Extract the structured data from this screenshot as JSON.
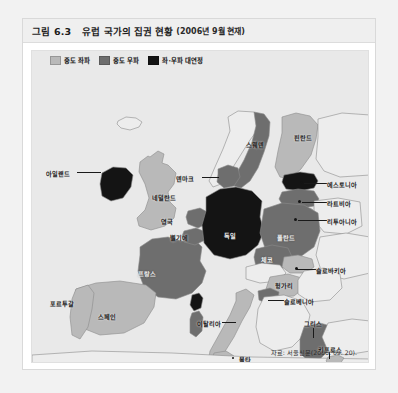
{
  "figure": {
    "number": "그림 6.3",
    "title": "유럽 국가의 집권 현황",
    "date": "(2006년 9월 현재)",
    "source": "자료: 서울신문(2006. 09. 20)."
  },
  "legend": {
    "items": [
      {
        "label": "중도 좌파",
        "color": "#b9b9b9"
      },
      {
        "label": "중도 우파",
        "color": "#6e6e6e"
      },
      {
        "label": "좌·우파 대연정",
        "color": "#141414"
      }
    ]
  },
  "colors": {
    "center_left": "#b9b9b9",
    "center_right": "#6e6e6e",
    "grand_coalition": "#141414",
    "no_data": "#ededed",
    "sea": "#e9e9e9",
    "outline": "#8c8c8c",
    "panel_bg": "#e9e9e9",
    "title_bg": "#efefef"
  },
  "map": {
    "countries": [
      {
        "name": "아일랜드",
        "category": "grand_coalition",
        "label_x": 50,
        "label_y": 122,
        "label_tone": "dark"
      },
      {
        "name": "영국",
        "category": "center_left",
        "label_x": 141,
        "label_y": 170,
        "label_tone": "dark"
      },
      {
        "name": "포르투갈",
        "category": "center_left",
        "label_x": 31,
        "label_y": 252,
        "label_tone": "dark"
      },
      {
        "name": "스페인",
        "category": "center_left",
        "label_x": 84,
        "label_y": 265,
        "label_tone": "dark"
      },
      {
        "name": "프랑스",
        "category": "center_right",
        "label_x": 119,
        "label_y": 222,
        "label_tone": "light"
      },
      {
        "name": "벨기에",
        "category": "center_right",
        "label_x": 152,
        "label_y": 186,
        "label_tone": "dark"
      },
      {
        "name": "네덜란드",
        "category": "center_right",
        "label_x": 148,
        "label_y": 146,
        "label_tone": "dark"
      },
      {
        "name": "덴마크",
        "category": "center_right",
        "label_x": 160,
        "label_y": 127,
        "label_tone": "dark"
      },
      {
        "name": "독일",
        "category": "grand_coalition",
        "label_x": 201,
        "label_y": 184,
        "label_tone": "light"
      },
      {
        "name": "이탈리아",
        "category": "center_left",
        "label_x": 186,
        "label_y": 272,
        "label_tone": "dark"
      },
      {
        "name": "폴란드",
        "category": "center_right",
        "label_x": 254,
        "label_y": 186,
        "label_tone": "light"
      },
      {
        "name": "체코",
        "category": "center_right",
        "label_x": 237,
        "label_y": 208,
        "label_tone": "light"
      },
      {
        "name": "슬로바키아",
        "category": "center_left",
        "label_x": 282,
        "label_y": 219,
        "label_tone": "dark"
      },
      {
        "name": "헝가리",
        "category": "center_left",
        "label_x": 252,
        "label_y": 234,
        "label_tone": "dark"
      },
      {
        "name": "슬로베니아",
        "category": "center_right",
        "label_x": 265,
        "label_y": 250,
        "label_tone": "dark"
      },
      {
        "name": "그리스",
        "category": "center_right",
        "label_x": 290,
        "label_y": 272,
        "label_tone": "dark"
      },
      {
        "name": "스웨덴",
        "category": "center_right",
        "label_x": 227,
        "label_y": 93,
        "label_tone": "dark"
      },
      {
        "name": "핀란드",
        "category": "center_left",
        "label_x": 293,
        "label_y": 86,
        "label_tone": "dark"
      },
      {
        "name": "에스토니아",
        "category": "grand_coalition",
        "label_x": 301,
        "label_y": 133,
        "label_tone": "dark"
      },
      {
        "name": "라트비아",
        "category": "center_right",
        "label_x": 303,
        "label_y": 152,
        "label_tone": "dark"
      },
      {
        "name": "리투아니아",
        "category": "center_left",
        "label_x": 303,
        "label_y": 170,
        "label_tone": "dark"
      },
      {
        "name": "키프로스",
        "category": "center_left",
        "label_x": 306,
        "label_y": 301,
        "label_tone": "dark"
      },
      {
        "name": "몰타",
        "category": "center_left",
        "label_x": 227,
        "label_y": 328,
        "label_tone": "dark"
      }
    ]
  }
}
